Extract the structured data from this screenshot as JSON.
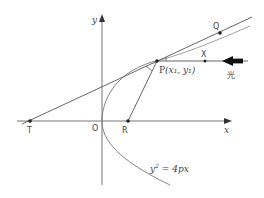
{
  "diagram": {
    "equation": "y² = 4px",
    "equation_base": "y",
    "equation_exp": "2",
    "equation_rest": " = 4px",
    "axes": {
      "x_label": "x",
      "y_label": "y"
    },
    "points": {
      "origin": "O",
      "focus": "R",
      "tangent_x_intercept": "T",
      "point_on_curve": "P",
      "point_on_curve_coords": "(x₁, y₁)",
      "point_on_ray": "X",
      "point_on_tangent": "Q"
    },
    "light_label": "光",
    "colors": {
      "line": "#555555",
      "curve": "#777777",
      "point": "#222222",
      "arrow": "#111111"
    }
  }
}
